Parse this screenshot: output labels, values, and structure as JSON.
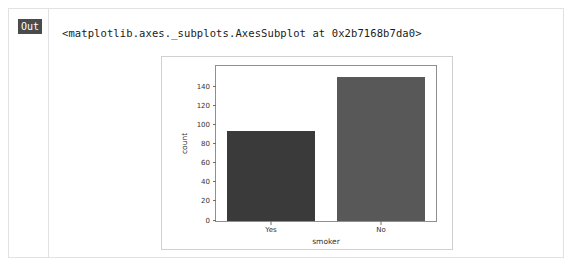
{
  "cell": {
    "prompt_label": "Out",
    "repr_text": "<matplotlib.axes._subplots.AxesSubplot at 0x2b7168b7da0>"
  },
  "colors": {
    "bar_yes": "#3a3a3a",
    "bar_no": "#585858",
    "axis_spine": "#8f8f8f",
    "figure_border": "#d0d0d0",
    "prompt_badge": "#4b4b4b",
    "tick_text": "#333333"
  },
  "chart_data": {
    "type": "bar",
    "title": "",
    "xlabel": "smoker",
    "ylabel": "count",
    "categories": [
      "Yes",
      "No"
    ],
    "values": [
      95,
      151
    ],
    "series": [
      {
        "name": "count",
        "values": [
          95,
          151
        ],
        "colors": [
          "#3a3a3a",
          "#585858"
        ]
      }
    ],
    "ylim": [
      0,
      163
    ],
    "yticks": [
      0,
      20,
      40,
      60,
      80,
      100,
      120,
      140
    ],
    "yticklabels": [
      "0",
      "20",
      "40",
      "60",
      "80",
      "100",
      "120",
      "140"
    ],
    "xticklabels": [
      "Yes",
      "No"
    ],
    "grid": false,
    "legend": false,
    "legend_position": "none"
  }
}
